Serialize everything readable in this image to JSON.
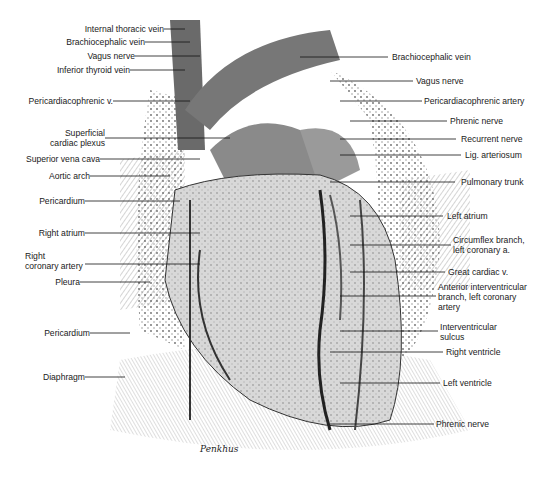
{
  "figure": {
    "artist_signature": "Penkhus",
    "left_labels": [
      {
        "text": "Internal thoracic vein",
        "y": 29
      },
      {
        "text": "Brachiocephalic vein",
        "y": 42
      },
      {
        "text": "Vagus nerve",
        "y": 56
      },
      {
        "text": "Inferior thyroid vein",
        "y": 70
      },
      {
        "text": "Pericardiacophrenic v.",
        "y": 101
      },
      {
        "text": "Superficial",
        "text2": "cardiac plexus",
        "y": 133
      },
      {
        "text": "Superior vena cava",
        "y": 159
      },
      {
        "text": "Aortic arch",
        "y": 176
      },
      {
        "text": "Pericardium",
        "y": 201
      },
      {
        "text": "Right atrium",
        "y": 233
      },
      {
        "text": "Right",
        "text2": "coronary artery",
        "y": 256
      },
      {
        "text": "Pleura",
        "y": 282
      },
      {
        "text": "Pericardium",
        "y": 333
      },
      {
        "text": "Diaphragm",
        "y": 377
      }
    ],
    "right_labels": [
      {
        "text": "Brachiocephalic vein",
        "y": 57
      },
      {
        "text": "Vagus nerve",
        "y": 81
      },
      {
        "text": "Pericardiacophrenic artery",
        "y": 101
      },
      {
        "text": "Phrenic nerve",
        "y": 121
      },
      {
        "text": "Recurrent nerve",
        "y": 139
      },
      {
        "text": "Lig. arteriosum",
        "y": 155
      },
      {
        "text": "Pulmonary trunk",
        "y": 182
      },
      {
        "text": "Left atrium",
        "y": 216
      },
      {
        "text": "Circumflex branch,",
        "text2": "left coronary a.",
        "y": 240
      },
      {
        "text": "Great cardiac v.",
        "y": 272
      },
      {
        "text": "Anterior interventricular",
        "text2": "branch, left coronary",
        "text3": "artery",
        "y": 287
      },
      {
        "text": "Interventricular",
        "text2": "sulcus",
        "y": 327
      },
      {
        "text": "Right ventricle",
        "y": 352
      },
      {
        "text": "Left ventricle",
        "y": 383
      },
      {
        "text": "Phrenic nerve",
        "y": 424
      }
    ]
  }
}
